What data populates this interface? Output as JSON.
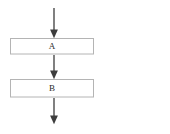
{
  "diagram": {
    "type": "flowchart",
    "orientation": "vertical",
    "background_color": "#ffffff",
    "nodes": [
      {
        "id": "node-a",
        "label": "A",
        "shape": "rectangle",
        "x": 10,
        "y": 38,
        "width": 84,
        "height": 17,
        "border_color": "#b4b4b4",
        "fill_color": "#ffffff",
        "text_color": "#2b2b2b"
      },
      {
        "id": "node-b",
        "label": "B",
        "shape": "rectangle",
        "x": 10,
        "y": 79,
        "width": 84,
        "height": 19,
        "border_color": "#b4b4b4",
        "fill_color": "#ffffff",
        "text_color": "#2b2b2b"
      }
    ],
    "edges": [
      {
        "id": "edge-entry",
        "from": "",
        "to": "node-a",
        "x": 54,
        "y_start": 8,
        "y_end": 38,
        "color": "#3d3d3d",
        "arrowhead": "filled-triangle"
      },
      {
        "id": "edge-a-to-b",
        "from": "node-a",
        "to": "node-b",
        "x": 54,
        "y_start": 55,
        "y_end": 79,
        "color": "#3d3d3d",
        "arrowhead": "filled-triangle"
      },
      {
        "id": "edge-exit",
        "from": "node-b",
        "to": "",
        "x": 54,
        "y_start": 98,
        "y_end": 124,
        "color": "#3d3d3d",
        "arrowhead": "filled-triangle"
      }
    ]
  }
}
